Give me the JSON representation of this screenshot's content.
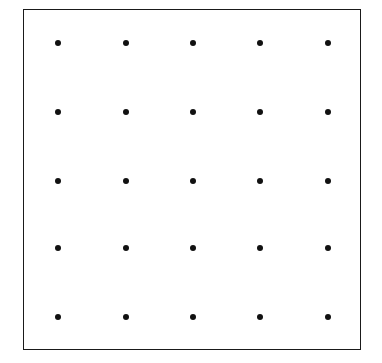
{
  "diagram": {
    "type": "dot-grid",
    "rows": 5,
    "cols": 5,
    "dot_color": "#111111",
    "border_color": "#1a1a1a",
    "background": "#ffffff",
    "col_x": [
      58,
      126,
      193,
      260,
      328
    ],
    "row_y": [
      43,
      112,
      181,
      248,
      317
    ]
  }
}
